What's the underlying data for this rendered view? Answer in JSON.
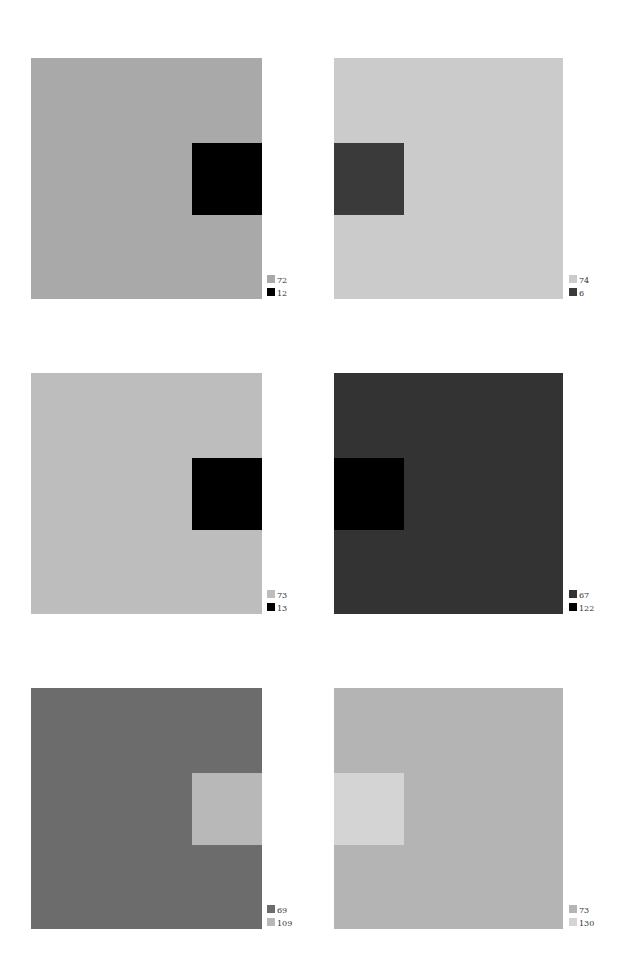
{
  "panels": [
    {
      "id": "p1",
      "background": "#a9a9a9",
      "inner": "#000000",
      "inner_side": "right",
      "legend": [
        {
          "swatch": "#a9a9a9",
          "value": "72"
        },
        {
          "swatch": "#000000",
          "value": "12"
        }
      ]
    },
    {
      "id": "p2",
      "background": "#cbcbcb",
      "inner": "#3a3a3a",
      "inner_side": "left",
      "legend": [
        {
          "swatch": "#cbcbcb",
          "value": "74"
        },
        {
          "swatch": "#3a3a3a",
          "value": "6"
        }
      ]
    },
    {
      "id": "p3",
      "background": "#bdbdbd",
      "inner": "#000000",
      "inner_side": "right",
      "legend": [
        {
          "swatch": "#bdbdbd",
          "value": "73"
        },
        {
          "swatch": "#000000",
          "value": "13"
        }
      ]
    },
    {
      "id": "p4",
      "background": "#333333",
      "inner": "#000000",
      "inner_side": "left",
      "legend": [
        {
          "swatch": "#333333",
          "value": "67"
        },
        {
          "swatch": "#000000",
          "value": "122"
        }
      ]
    },
    {
      "id": "p5",
      "background": "#6c6c6c",
      "inner": "#b8b8b8",
      "inner_side": "right",
      "legend": [
        {
          "swatch": "#6c6c6c",
          "value": "69"
        },
        {
          "swatch": "#b8b8b8",
          "value": "109"
        }
      ]
    },
    {
      "id": "p6",
      "background": "#b4b4b4",
      "inner": "#d4d4d4",
      "inner_side": "left",
      "legend": [
        {
          "swatch": "#b4b4b4",
          "value": "73"
        },
        {
          "swatch": "#d4d4d4",
          "value": "130"
        }
      ]
    }
  ]
}
